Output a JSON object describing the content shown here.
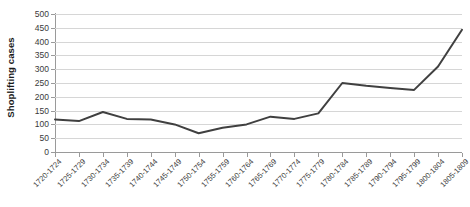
{
  "chart_data": {
    "type": "line",
    "title": "",
    "xlabel": "",
    "ylabel": "Shoplifting cases",
    "ylim": [
      0,
      500
    ],
    "ytick_step": 50,
    "yticks": [
      500,
      450,
      400,
      350,
      300,
      250,
      200,
      150,
      100,
      50,
      0
    ],
    "grid": true,
    "legend": "none",
    "line_color": "#404040",
    "line_width": 2,
    "categories": [
      "1720-1724",
      "1725-1729",
      "1730-1734",
      "1735-1739",
      "1740-1744",
      "1745-1749",
      "1750-1754",
      "1755-1759",
      "1760-1764",
      "1765-1769",
      "1770-1774",
      "1775-1779",
      "1780-1784",
      "1785-1789",
      "1790-1794",
      "1795-1799",
      "1800-1804",
      "1805-1809"
    ],
    "values": [
      118,
      112,
      145,
      120,
      118,
      100,
      68,
      88,
      100,
      128,
      120,
      140,
      250,
      240,
      232,
      225,
      310,
      443
    ]
  }
}
